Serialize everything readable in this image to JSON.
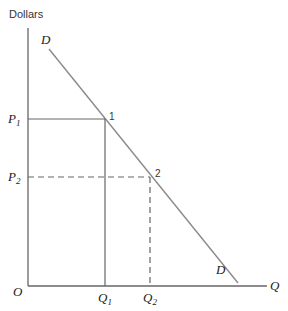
{
  "diagram": {
    "type": "demand-curve",
    "y_axis_label": "Dollars",
    "x_axis_label": "Q",
    "origin_label": "O",
    "curve_label_top": "D",
    "curve_label_bottom": "D",
    "price_levels": [
      {
        "label": "P",
        "subscript": "1"
      },
      {
        "label": "P",
        "subscript": "2"
      }
    ],
    "quantity_levels": [
      {
        "label": "Q",
        "subscript": "1"
      },
      {
        "label": "Q",
        "subscript": "2"
      }
    ],
    "points": [
      {
        "label": "1",
        "price": "P1",
        "quantity": "Q1",
        "guide_style": "solid"
      },
      {
        "label": "2",
        "price": "P2",
        "quantity": "Q2",
        "guide_style": "dashed"
      }
    ],
    "colors": {
      "axis": "#666666",
      "curve": "#8a8a8a",
      "guides": "#666666",
      "text": "#222222"
    }
  }
}
